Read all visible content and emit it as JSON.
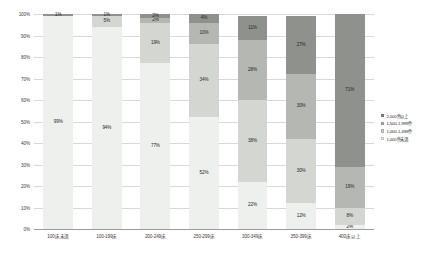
{
  "chart_data": {
    "type": "bar",
    "stacked": true,
    "stack_mode": "percent",
    "title": "",
    "subtitle": "",
    "xlabel": "",
    "ylabel": "",
    "ylim": [
      0,
      100
    ],
    "grid": true,
    "legend_position": "right",
    "categories": [
      "100床未満",
      "100-199床",
      "200-249床",
      "250-299床",
      "300-349床",
      "350-399床",
      "400床以上"
    ],
    "ytick_labels": [
      "0%",
      "10%",
      "20%",
      "30%",
      "40%",
      "50%",
      "60%",
      "70%",
      "80%",
      "90%",
      "100%"
    ],
    "ytick_values": [
      0,
      10,
      20,
      30,
      40,
      50,
      60,
      70,
      80,
      90,
      100
    ],
    "series": [
      {
        "name": "1,000件未満",
        "color": "#eef0ee",
        "values": [
          99,
          94,
          77,
          52,
          22,
          12,
          2
        ],
        "labels": [
          "99%",
          "94%",
          "77%",
          "52%",
          "22%",
          "12%",
          "2%"
        ]
      },
      {
        "name": "1,000-1,499件",
        "color": "#d3d6d1",
        "values": [
          0,
          5,
          19,
          34,
          38,
          30,
          8
        ],
        "labels": [
          "",
          "5%",
          "19%",
          "34%",
          "38%",
          "30%",
          "8%"
        ]
      },
      {
        "name": "1,500-1,999件",
        "color": "#b4b7b2",
        "values": [
          0,
          0,
          2,
          10,
          28,
          30,
          19
        ],
        "labels": [
          "",
          "",
          "2%",
          "10%",
          "28%",
          "30%",
          "19%"
        ]
      },
      {
        "name": "2,000件以上",
        "color": "#8e918c",
        "values": [
          1,
          1,
          2,
          4,
          11,
          27,
          71
        ],
        "labels": [
          "1%",
          "1%",
          "2%",
          "4%",
          "11%",
          "27%",
          "71%"
        ]
      }
    ],
    "legend_entries": [
      {
        "label": "2,000件以上",
        "color": "#8e918c"
      },
      {
        "label": "1,500-1,999件",
        "color": "#b4b7b2"
      },
      {
        "label": "1,000-1,499件",
        "color": "#d3d6d1"
      },
      {
        "label": "1,000件未満",
        "color": "#eef0ee"
      }
    ],
    "colors": {
      "gridline": "#d9d9d9",
      "axis": "#9a9a9a",
      "text": "#303030",
      "background": "#ffffff"
    }
  }
}
